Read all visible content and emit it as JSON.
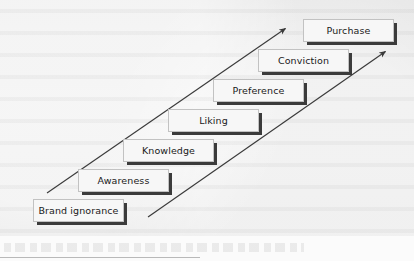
{
  "diagram": {
    "type": "staircase",
    "title": "",
    "background_color": "#e8e8e8",
    "box_fill_color": "#f7f7f7",
    "box_shadow_color": "#3b3b3b",
    "arrow_color": "#3a3a3a",
    "steps": [
      {
        "label": "Brand ignorance",
        "level": 1
      },
      {
        "label": "Awareness",
        "level": 2
      },
      {
        "label": "Knowledge",
        "level": 3
      },
      {
        "label": "Liking",
        "level": 4
      },
      {
        "label": "Preference",
        "level": 5
      },
      {
        "label": "Conviction",
        "level": 6
      },
      {
        "label": "Purchase",
        "level": 7
      }
    ],
    "arrows": [
      {
        "name": "upper-progression-arrow",
        "direction": "up-right"
      },
      {
        "name": "lower-progression-arrow",
        "direction": "up-right"
      }
    ]
  }
}
